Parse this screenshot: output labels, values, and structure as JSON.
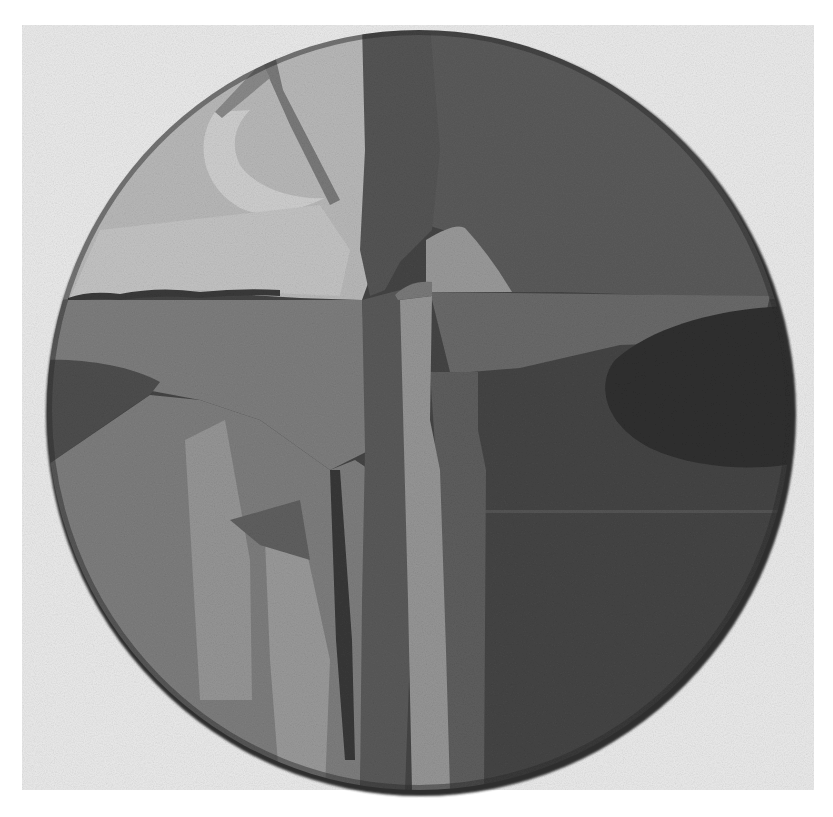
{
  "image": {
    "kind": "photograph",
    "subject": "circular abstract painting (tondo) in grayscale",
    "alt": "Grayscale photograph of a round abstract painting with vertical columns, a light peaked shape, a dark oval on the right and a textured light area at upper left"
  },
  "palette": {
    "page": "#ffffff",
    "backdrop": "#ebebeb",
    "rim_shadow": "#2e2e2e",
    "upper_left_light": "#b9b9b9",
    "upper_left_lighter": "#cfcfcf",
    "upper_right_field": "#5b5b5b",
    "central_column": "#555555",
    "peak_light": "#9a9a9a",
    "band_mid": "#6a6a6a",
    "dark_oval": "#303030",
    "lower_right_field": "#454545",
    "lower_left_field": "#7e7e7e",
    "light_column": "#969696",
    "left_wedge": "#4e4e4e",
    "stroke_dark": "#3a3a3a"
  },
  "shapes": {
    "tondo": {
      "cx": 419,
      "cy": 410,
      "rx": 374,
      "ry": 382
    },
    "backdrop": {
      "x": 22,
      "y": 25,
      "w": 792,
      "h": 765
    }
  }
}
